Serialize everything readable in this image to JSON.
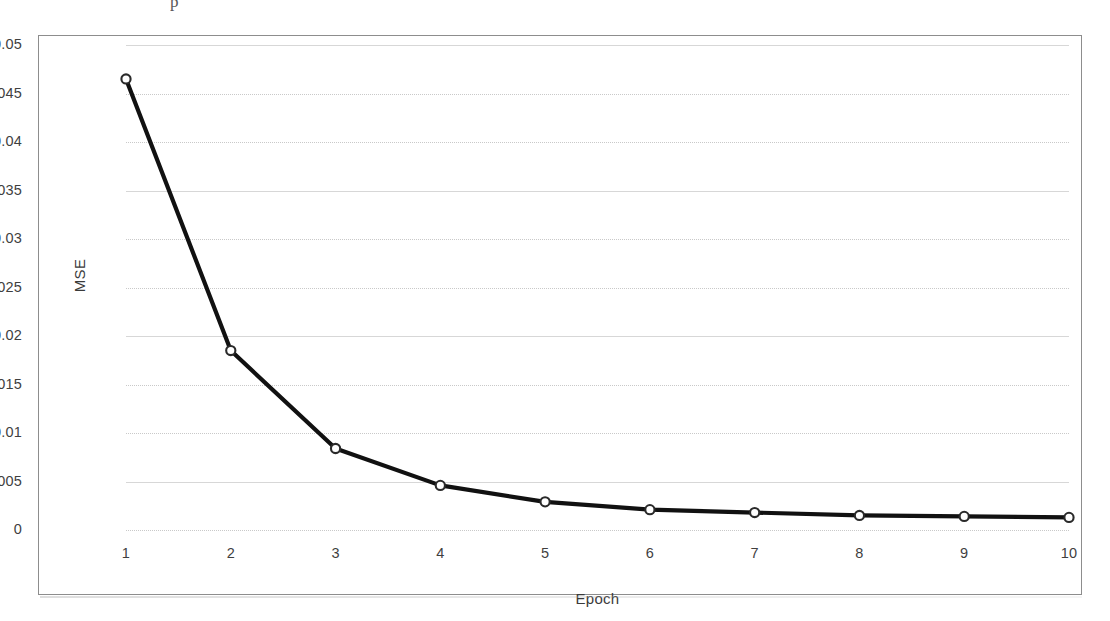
{
  "artifact": {
    "top_fragment": "p"
  },
  "chart_data": {
    "type": "line",
    "title": "",
    "xlabel": "Epoch",
    "ylabel": "MSE",
    "categories": [
      1,
      2,
      3,
      4,
      5,
      6,
      7,
      8,
      9,
      10
    ],
    "x_tick_labels": [
      "1",
      "2",
      "3",
      "4",
      "5",
      "6",
      "7",
      "8",
      "9",
      "10"
    ],
    "values": [
      0.0465,
      0.0185,
      0.0084,
      0.0046,
      0.0029,
      0.0021,
      0.0018,
      0.0015,
      0.0014,
      0.0013
    ],
    "series": [
      {
        "name": "MSE",
        "values": [
          0.0465,
          0.0185,
          0.0084,
          0.0046,
          0.0029,
          0.0021,
          0.0018,
          0.0015,
          0.0014,
          0.0013
        ]
      }
    ],
    "ylim": [
      0,
      0.05
    ],
    "xlim": [
      1,
      10
    ],
    "y_ticks": [
      0,
      0.005,
      0.01,
      0.015,
      0.02,
      0.025,
      0.03,
      0.035,
      0.04,
      0.045,
      0.05
    ],
    "y_tick_labels": [
      "0",
      "0.005",
      "0.01",
      "0.015",
      "0.02",
      "0.025",
      "0.03",
      "0.035",
      "0.04",
      "0.045",
      "0.05"
    ],
    "grid": true,
    "grid_axis": "y",
    "legend": false,
    "legend_position": "none",
    "marker": "circle-open",
    "line_color": "#111111",
    "marker_face_color": "#ffffff",
    "marker_edge_color": "#2a2a2a",
    "grid_color": "#c9c9c9",
    "frame_color": "#8d8d8d",
    "background": "#ffffff"
  }
}
